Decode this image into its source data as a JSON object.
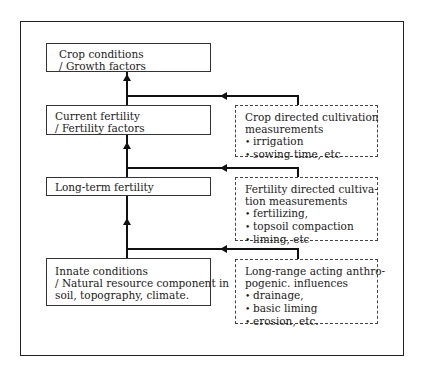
{
  "diagram": {
    "levels": [
      {
        "id": "crop-conditions",
        "lines": [
          "Crop conditions",
          "/ Growth factors"
        ]
      },
      {
        "id": "current-fertility",
        "lines": [
          "Current fertility",
          "/ Fertility factors"
        ]
      },
      {
        "id": "long-term-fertility",
        "lines": [
          "Long-term fertility"
        ]
      },
      {
        "id": "innate-conditions",
        "lines": [
          "Innate conditions",
          "/ Natural resource component in",
          "soil, topography, climate."
        ]
      }
    ],
    "influences": [
      {
        "id": "crop-directed",
        "title_lines": [
          "Crop directed cultivation",
          "measurements"
        ],
        "bullets": [
          "irrigation",
          "sowing time, etc"
        ]
      },
      {
        "id": "fertility-directed",
        "title_lines": [
          "Fertility directed cultiva-",
          "tion measurements"
        ],
        "bullets": [
          "fertilizing,",
          "topsoil compaction",
          "liming, etc"
        ]
      },
      {
        "id": "long-range",
        "title_lines": [
          "Long-range acting anthro-",
          "pogenic. influences"
        ],
        "bullets": [
          "drainage,",
          "basic liming",
          "erosion, etc."
        ]
      }
    ],
    "colors": {
      "line": "#111111",
      "background": "#ffffff"
    }
  }
}
